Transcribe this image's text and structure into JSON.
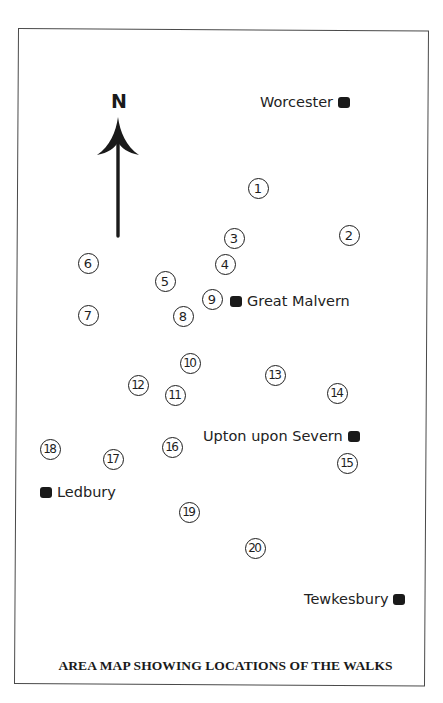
{
  "map": {
    "caption": "AREA MAP SHOWING LOCATIONS OF THE WALKS",
    "compass": {
      "label": "N",
      "direction": "north"
    },
    "towns": [
      {
        "name": "Worcester",
        "marker_side": "right",
        "x": 260,
        "y": 102
      },
      {
        "name": "Great Malvern",
        "marker_side": "left",
        "x": 230,
        "y": 301
      },
      {
        "name": "Upton upon Severn",
        "marker_side": "right",
        "x": 203,
        "y": 436
      },
      {
        "name": "Ledbury",
        "marker_side": "left",
        "x": 40,
        "y": 492
      },
      {
        "name": "Tewkesbury",
        "marker_side": "right",
        "x": 304,
        "y": 599
      }
    ],
    "walks": [
      {
        "label": "1",
        "x": 258,
        "y": 188
      },
      {
        "label": "2",
        "x": 349,
        "y": 235
      },
      {
        "label": "3",
        "x": 234,
        "y": 238
      },
      {
        "label": "4",
        "x": 225,
        "y": 264
      },
      {
        "label": "5",
        "x": 165,
        "y": 281
      },
      {
        "label": "6",
        "x": 88,
        "y": 263
      },
      {
        "label": "7",
        "x": 88,
        "y": 315
      },
      {
        "label": "8",
        "x": 183,
        "y": 316
      },
      {
        "label": "9",
        "x": 212,
        "y": 299
      },
      {
        "label": "10",
        "x": 190,
        "y": 363
      },
      {
        "label": "11",
        "x": 175,
        "y": 395
      },
      {
        "label": "12",
        "x": 138,
        "y": 385
      },
      {
        "label": "13",
        "x": 275,
        "y": 375
      },
      {
        "label": "14",
        "x": 337,
        "y": 393
      },
      {
        "label": "15",
        "x": 347,
        "y": 463
      },
      {
        "label": "16",
        "x": 172,
        "y": 447
      },
      {
        "label": "17",
        "x": 113,
        "y": 459
      },
      {
        "label": "18",
        "x": 50,
        "y": 449
      },
      {
        "label": "19",
        "x": 189,
        "y": 512
      },
      {
        "label": "20",
        "x": 255,
        "y": 548
      }
    ],
    "colors": {
      "ink": "#1e1e1e",
      "frame": "#4a4a4a",
      "background": "#ffffff"
    }
  }
}
